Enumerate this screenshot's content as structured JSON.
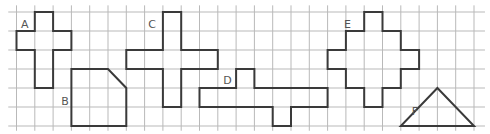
{
  "grid": {
    "origin_x": 16.5,
    "origin_y": 12,
    "cell_w": 18.3,
    "cell_h": 19,
    "cols_from": -0.45,
    "cols_to": 25.6,
    "rows_from": -0.35,
    "rows_to": 6.25,
    "line_color": "#b9b9b9"
  },
  "shape_color": "#3a3a3a",
  "shapes": [
    {
      "id": "A",
      "label": "A",
      "label_pos": [
        0.25,
        0.85
      ],
      "points": [
        [
          1,
          0
        ],
        [
          2,
          0
        ],
        [
          2,
          1
        ],
        [
          3,
          1
        ],
        [
          3,
          2
        ],
        [
          2,
          2
        ],
        [
          2,
          4
        ],
        [
          1,
          4
        ],
        [
          1,
          2
        ],
        [
          0,
          2
        ],
        [
          0,
          1
        ],
        [
          1,
          1
        ]
      ]
    },
    {
      "id": "B",
      "label": "B",
      "label_pos": [
        2.45,
        4.9
      ],
      "points": [
        [
          3,
          3
        ],
        [
          5,
          3
        ],
        [
          6,
          4
        ],
        [
          6,
          6
        ],
        [
          3,
          6
        ]
      ]
    },
    {
      "id": "C",
      "label": "C",
      "label_pos": [
        7.2,
        0.85
      ],
      "points": [
        [
          8,
          0
        ],
        [
          9,
          0
        ],
        [
          9,
          2
        ],
        [
          11,
          2
        ],
        [
          11,
          3
        ],
        [
          9,
          3
        ],
        [
          9,
          5
        ],
        [
          8,
          5
        ],
        [
          8,
          3
        ],
        [
          6,
          3
        ],
        [
          6,
          2
        ],
        [
          8,
          2
        ]
      ]
    },
    {
      "id": "D",
      "label": "D",
      "label_pos": [
        11.3,
        3.8
      ],
      "points": [
        [
          12,
          3
        ],
        [
          13,
          3
        ],
        [
          13,
          4
        ],
        [
          17,
          4
        ],
        [
          17,
          5
        ],
        [
          15,
          5
        ],
        [
          15,
          6
        ],
        [
          14,
          6
        ],
        [
          14,
          5
        ],
        [
          10,
          5
        ],
        [
          10,
          4
        ],
        [
          12,
          4
        ]
      ]
    },
    {
      "id": "E",
      "label": "E",
      "label_pos": [
        17.9,
        0.85
      ],
      "points": [
        [
          19,
          0
        ],
        [
          20,
          0
        ],
        [
          20,
          1
        ],
        [
          21,
          1
        ],
        [
          21,
          2
        ],
        [
          22,
          2
        ],
        [
          22,
          3
        ],
        [
          21,
          3
        ],
        [
          21,
          4
        ],
        [
          20,
          4
        ],
        [
          20,
          5
        ],
        [
          19,
          5
        ],
        [
          19,
          4
        ],
        [
          18,
          4
        ],
        [
          18,
          3
        ],
        [
          17,
          3
        ],
        [
          17,
          2
        ],
        [
          18,
          2
        ],
        [
          18,
          1
        ],
        [
          19,
          1
        ]
      ]
    },
    {
      "id": "F",
      "label": "F",
      "label_pos": [
        21.6,
        5.4
      ],
      "points": [
        [
          23,
          4
        ],
        [
          25,
          6
        ],
        [
          21,
          6
        ]
      ]
    }
  ]
}
